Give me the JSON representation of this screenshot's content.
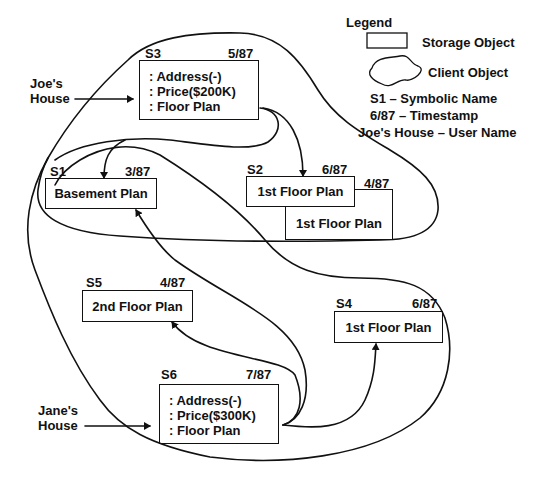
{
  "legend": {
    "title": "Legend",
    "storage_object": "Storage Object",
    "client_object": "Client Object",
    "symbolic_name": "S1 – Symbolic Name",
    "timestamp": "6/87 – Timestamp",
    "user_name": "Joe's House – User Name"
  },
  "clients": [
    {
      "user_name_line1": "Joe's",
      "user_name_line2": "House"
    },
    {
      "user_name_line1": "Jane's",
      "user_name_line2": "House"
    }
  ],
  "storage_objects": {
    "S3": {
      "name": "S3",
      "timestamp": "5/87",
      "lines": [
        ": Address(-)",
        ": Price($200K)",
        ": Floor Plan"
      ]
    },
    "S1": {
      "name": "S1",
      "timestamp": "3/87",
      "label": "Basement Plan"
    },
    "S2": {
      "name": "S2",
      "timestamp": "6/87",
      "label": "1st Floor Plan"
    },
    "S2_old": {
      "timestamp": "4/87",
      "label": "1st Floor Plan"
    },
    "S5": {
      "name": "S5",
      "timestamp": "4/87",
      "label": "2nd Floor Plan"
    },
    "S4": {
      "name": "S4",
      "timestamp": "6/87",
      "label": "1st Floor Plan"
    },
    "S6": {
      "name": "S6",
      "timestamp": "7/87",
      "lines": [
        ": Address(-)",
        ": Price($300K)",
        ": Floor Plan"
      ]
    }
  },
  "references": [
    {
      "from": "S3",
      "to": "S1"
    },
    {
      "from": "S3",
      "to": "S2"
    },
    {
      "from": "S6",
      "to": "S1"
    },
    {
      "from": "S6",
      "to": "S5"
    },
    {
      "from": "S6",
      "to": "S4"
    }
  ]
}
